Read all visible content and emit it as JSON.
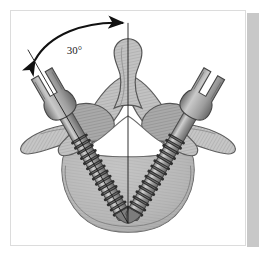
{
  "figure": {
    "domain_label": "anatomical-diagram",
    "annotation": {
      "angle_label": "30°",
      "angle_value": 30,
      "angle_unit": "degrees",
      "description": "Convergence angle between the vertebral midline and the pedicle screw trajectory"
    },
    "colors": {
      "background": "#ffffff",
      "frame_border": "#dcdcdc",
      "page_shadow": "#c8c8c8",
      "bone_light": "#d4d4d4",
      "bone_mid": "#a8a8a8",
      "bone_dark": "#8a8a8a",
      "bone_outline": "#5a5a5a",
      "canal_fill": "#ffffff",
      "screw_light": "#c0c0c0",
      "screw_mid": "#909090",
      "screw_dark": "#3a3a3a",
      "thread_dark": "#2e2e2e",
      "annotation_ink": "#111111"
    },
    "parts": [
      {
        "name": "spinous-process",
        "label": "Spinous process"
      },
      {
        "name": "vertebral-body",
        "label": "Vertebral body"
      },
      {
        "name": "vertebral-canal",
        "label": "Vertebral canal"
      },
      {
        "name": "lamina-left",
        "label": "Left lamina"
      },
      {
        "name": "lamina-right",
        "label": "Right lamina"
      },
      {
        "name": "transverse-process-left",
        "label": "Left transverse process"
      },
      {
        "name": "transverse-process-right",
        "label": "Right transverse process"
      },
      {
        "name": "pedicle-screw-left",
        "label": "Left pedicle screw"
      },
      {
        "name": "pedicle-screw-right",
        "label": "Right pedicle screw"
      },
      {
        "name": "midline-axis",
        "label": "Vertical midline reference axis"
      },
      {
        "name": "trajectory-axis",
        "label": "Screw trajectory reference axis"
      }
    ]
  }
}
